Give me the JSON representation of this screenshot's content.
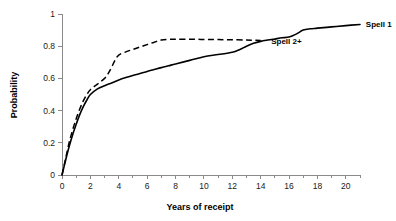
{
  "chart_data": {
    "type": "line",
    "title": "",
    "xlabel": "Years of receipt",
    "ylabel": "Probability",
    "xlim": [
      0,
      21
    ],
    "ylim": [
      0,
      1
    ],
    "grid": false,
    "legend_position": "inline-at-curve-end",
    "x_ticks": [
      0,
      2,
      4,
      6,
      8,
      10,
      12,
      14,
      16,
      18,
      20
    ],
    "x_tick_labels": [
      "0",
      "2",
      "4",
      "6",
      "8",
      "10",
      "12",
      "14",
      "16",
      "18",
      "20"
    ],
    "x_minor_ticks": [
      1,
      3,
      5,
      7,
      9,
      11,
      13,
      15,
      17,
      19,
      21
    ],
    "y_ticks": [
      0,
      0.2,
      0.4,
      0.6,
      0.8,
      1
    ],
    "y_tick_labels": [
      "0",
      "0.2",
      "0.4",
      "0.6",
      "0.8",
      "1"
    ],
    "series": [
      {
        "name": "Spell 1",
        "style": "solid",
        "color": "#000000",
        "label_x": 21.2,
        "label_y": 0.935,
        "x": [
          0,
          0.25,
          0.5,
          0.75,
          1,
          1.25,
          1.5,
          1.75,
          2,
          2.5,
          3,
          3.5,
          4,
          4.5,
          5,
          5.5,
          6,
          6.5,
          7,
          7.5,
          8,
          9,
          10,
          11,
          12,
          12.5,
          13,
          13.5,
          14,
          14.5,
          15,
          15.5,
          16,
          16.5,
          17,
          17.5,
          18,
          19,
          20,
          21
        ],
        "y": [
          0,
          0.09,
          0.175,
          0.25,
          0.315,
          0.375,
          0.425,
          0.465,
          0.5,
          0.535,
          0.555,
          0.572,
          0.59,
          0.605,
          0.618,
          0.63,
          0.643,
          0.655,
          0.667,
          0.678,
          0.69,
          0.712,
          0.735,
          0.748,
          0.762,
          0.778,
          0.8,
          0.818,
          0.83,
          0.838,
          0.845,
          0.852,
          0.857,
          0.875,
          0.9,
          0.908,
          0.912,
          0.92,
          0.928,
          0.935
        ]
      },
      {
        "name": "Spell 2+",
        "style": "dashed",
        "color": "#000000",
        "label_x": 14.6,
        "label_y": 0.835,
        "x": [
          0,
          0.25,
          0.5,
          0.75,
          1,
          1.25,
          1.5,
          1.75,
          2,
          2.5,
          3,
          3.25,
          3.5,
          3.75,
          4,
          4.5,
          5,
          5.5,
          6,
          6.5,
          7,
          7.5,
          8,
          9,
          10,
          11,
          12,
          13,
          13.5,
          14
        ],
        "y": [
          0,
          0.1,
          0.2,
          0.28,
          0.35,
          0.41,
          0.46,
          0.5,
          0.53,
          0.565,
          0.6,
          0.63,
          0.67,
          0.715,
          0.745,
          0.765,
          0.78,
          0.795,
          0.81,
          0.825,
          0.838,
          0.842,
          0.843,
          0.843,
          0.842,
          0.841,
          0.84,
          0.838,
          0.837,
          0.836
        ]
      }
    ]
  }
}
